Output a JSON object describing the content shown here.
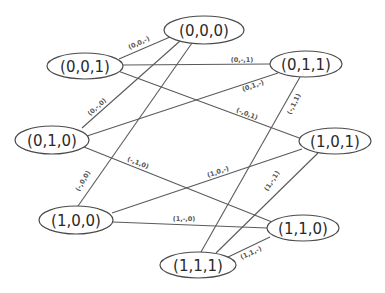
{
  "diagram": {
    "type": "graph",
    "title": "",
    "nodes": [
      {
        "id": "n000",
        "label": "(0,0,0)",
        "cx": 204,
        "cy": 30,
        "rx": 40,
        "ry": 14
      },
      {
        "id": "n001",
        "label": "(0,0,1)",
        "cx": 85,
        "cy": 66,
        "rx": 38,
        "ry": 13
      },
      {
        "id": "n011",
        "label": "(0,1,1)",
        "cx": 306,
        "cy": 64,
        "rx": 36,
        "ry": 13
      },
      {
        "id": "n010",
        "label": "(0,1,0)",
        "cx": 52,
        "cy": 140,
        "rx": 37,
        "ry": 14
      },
      {
        "id": "n101",
        "label": "(1,0,1)",
        "cx": 335,
        "cy": 141,
        "rx": 36,
        "ry": 13
      },
      {
        "id": "n100",
        "label": "(1,0,0)",
        "cx": 76,
        "cy": 220,
        "rx": 37,
        "ry": 14
      },
      {
        "id": "n110",
        "label": "(1,1,0)",
        "cx": 303,
        "cy": 228,
        "rx": 36,
        "ry": 13
      },
      {
        "id": "n111",
        "label": "(1,1,1)",
        "cx": 198,
        "cy": 265,
        "rx": 38,
        "ry": 13
      }
    ],
    "edges": [
      {
        "from": "n001",
        "to": "n000",
        "label": "(0,0,-)",
        "x1": 119,
        "y1": 59,
        "x2": 170,
        "y2": 37,
        "lx": 139,
        "ly": 43,
        "angle": -25
      },
      {
        "from": "n001",
        "to": "n011",
        "label": "(0,-,1)",
        "x1": 122,
        "y1": 65,
        "x2": 270,
        "y2": 64,
        "lx": 242,
        "ly": 60,
        "angle": 0
      },
      {
        "from": "n001",
        "to": "n101",
        "label": "(-,0,1)",
        "x1": 118,
        "y1": 71,
        "x2": 302,
        "y2": 139,
        "lx": 247,
        "ly": 114,
        "angle": 21
      },
      {
        "from": "n010",
        "to": "n000",
        "label": "(0,-,0)",
        "x1": 82,
        "y1": 128,
        "x2": 180,
        "y2": 41,
        "lx": 97,
        "ly": 107,
        "angle": -42
      },
      {
        "from": "n010",
        "to": "n011",
        "label": "(0,1,-)",
        "x1": 87,
        "y1": 136,
        "x2": 278,
        "y2": 73,
        "lx": 253,
        "ly": 86,
        "angle": -19
      },
      {
        "from": "n010",
        "to": "n110",
        "label": "(-,1,0)",
        "x1": 84,
        "y1": 147,
        "x2": 272,
        "y2": 222,
        "lx": 138,
        "ly": 163,
        "angle": 21
      },
      {
        "from": "n100",
        "to": "n000",
        "label": "(-,0,0)",
        "x1": 78,
        "y1": 206,
        "x2": 192,
        "y2": 43,
        "lx": 83,
        "ly": 181,
        "angle": -60
      },
      {
        "from": "n100",
        "to": "n101",
        "label": "(1,0,-)",
        "x1": 112,
        "y1": 213,
        "x2": 302,
        "y2": 149,
        "lx": 218,
        "ly": 172,
        "angle": -19
      },
      {
        "from": "n100",
        "to": "n110",
        "label": "(1,-,0)",
        "x1": 113,
        "y1": 222,
        "x2": 267,
        "y2": 228,
        "lx": 184,
        "ly": 219,
        "angle": 0
      },
      {
        "from": "n111",
        "to": "n011",
        "label": "(-,1,1)",
        "x1": 201,
        "y1": 252,
        "x2": 300,
        "y2": 77,
        "lx": 294,
        "ly": 104,
        "angle": -64
      },
      {
        "from": "n111",
        "to": "n101",
        "label": "(1,-,1)",
        "x1": 216,
        "y1": 253,
        "x2": 318,
        "y2": 153,
        "lx": 272,
        "ly": 181,
        "angle": -57
      },
      {
        "from": "n111",
        "to": "n110",
        "label": "(1,1,-)",
        "x1": 226,
        "y1": 258,
        "x2": 270,
        "y2": 237,
        "lx": 251,
        "ly": 253,
        "angle": -25
      }
    ]
  },
  "colors": {
    "background": "#ffffff",
    "edge": "#5a5a5a",
    "node_stroke": "#4a4a4a",
    "node_text": "#2a2a2a",
    "edge_text": "#555555"
  }
}
